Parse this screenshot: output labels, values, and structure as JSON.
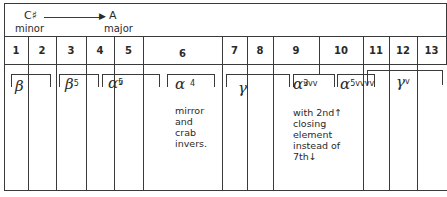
{
  "key_change": {
    "from_key": "C♯",
    "from_mode": "minor",
    "arrow": "→",
    "to_key": "A",
    "to_mode": "major"
  },
  "columns": [
    "1",
    "2",
    "3",
    "4",
    "5",
    "6",
    "7",
    "8",
    "9",
    "10",
    "11",
    "12",
    "13"
  ],
  "groups": [
    {
      "symbol": "β",
      "sup": "",
      "sub": "",
      "spans": "1-2"
    },
    {
      "symbol": "β",
      "sup": "5",
      "sub": "",
      "spans": "3-4"
    },
    {
      "symbol": "α",
      "sup": "5",
      "sub": "v",
      "spans": "4-5"
    },
    {
      "symbol": "α",
      "sup": "4",
      "sub": "",
      "spans": "6",
      "note": "mirror\nand\ncrab\ninvers."
    },
    {
      "symbol": "γ",
      "sup": "",
      "sub": "",
      "spans": "7-8"
    },
    {
      "symbol": "α",
      "sup": "3",
      "sub": "vvv",
      "spans": "9",
      "note": "with 2nd↑\nclosing\nelement\ninstead of\n7th↓"
    },
    {
      "symbol": "α",
      "sup": "",
      "sub": "5vvvv",
      "spans": "10"
    },
    {
      "symbol": "γ",
      "sup": "",
      "sub": "v",
      "spans": "11-13"
    }
  ]
}
